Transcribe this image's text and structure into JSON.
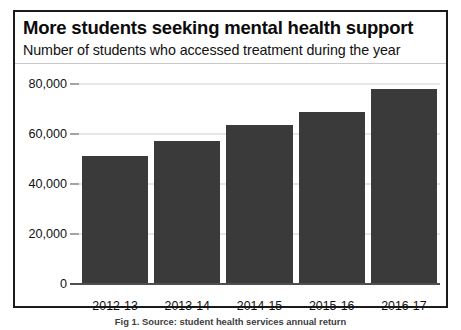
{
  "chart_data": {
    "type": "bar",
    "title": "More students seeking mental health support",
    "subtitle": "Number of students who accessed treatment during the year",
    "categories": [
      "2012-13",
      "2013-14",
      "2014-15",
      "2015-16",
      "2016-17"
    ],
    "values": [
      51000,
      57200,
      63600,
      68800,
      78000
    ],
    "xlabel": "",
    "ylabel": "",
    "ylim": [
      0,
      80000
    ],
    "yticks": [
      0,
      20000,
      40000,
      60000,
      80000
    ],
    "ytick_labels": [
      "0",
      "20,000",
      "40,000",
      "60,000",
      "80,000"
    ],
    "grid": true,
    "legend": false,
    "bar_color": "#3a3a3a"
  },
  "caption": {
    "text": "Fig 1. Source: student health services annual return"
  },
  "ticks": {
    "t0": "0",
    "t1": "20,000",
    "t2": "40,000",
    "t3": "60,000",
    "t4": "80,000"
  },
  "bars": [
    {
      "label": "2012-13",
      "value": 51000
    },
    {
      "label": "2013-14",
      "value": 57200
    },
    {
      "label": "2014-15",
      "value": 63600
    },
    {
      "label": "2015-16",
      "value": 68800
    },
    {
      "label": "2016-17",
      "value": 78000
    }
  ]
}
